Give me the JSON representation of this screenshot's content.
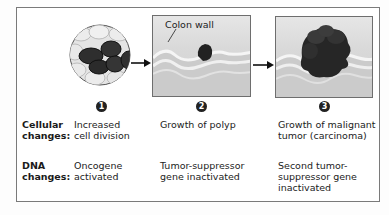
{
  "figure": {
    "stages": [
      {
        "number": "1",
        "image": "cell-cluster-icon",
        "cellular_change": [
          "Increased",
          "cell division"
        ],
        "dna_change": [
          "Oncogene",
          "activated"
        ]
      },
      {
        "number": "2",
        "image": "polyp-on-colon-wall",
        "callout": "Colon wall",
        "cellular_change": [
          "Growth of polyp"
        ],
        "dna_change": [
          "Tumor-suppressor",
          "gene inactivated"
        ]
      },
      {
        "number": "3",
        "image": "carcinoma-on-colon-wall",
        "cellular_change": [
          "Growth of malignant",
          "tumor (carcinoma)"
        ],
        "dna_change": [
          "Second tumor-",
          "suppressor gene",
          "inactivated"
        ]
      }
    ],
    "row_labels": {
      "cellular": [
        "Cellular",
        "changes:"
      ],
      "dna": [
        "DNA",
        "changes:"
      ]
    },
    "arrows": [
      "arrow-right-icon",
      "arrow-right-icon"
    ],
    "colors": {
      "frame": "#7a7a7a",
      "panel_bg": "#d9d9d9",
      "dark_cell": "#2e2e2e",
      "light_cell": "#e0e0e0",
      "tumor": "#1f1f1f"
    }
  }
}
